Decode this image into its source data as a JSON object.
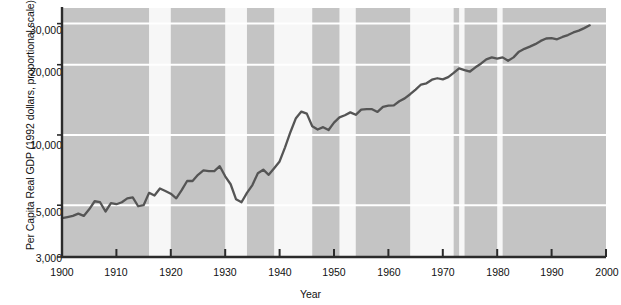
{
  "chart_data": {
    "type": "line",
    "title": "",
    "xlabel": "Year",
    "ylabel": "Per Capita Real GDP (1992 dollars, proportional scale)",
    "yscale": "log",
    "ylim": [
      3000,
      35000
    ],
    "xlim": [
      1900,
      2000
    ],
    "grid": true,
    "legend": "none",
    "yticks": [
      {
        "value": 3000,
        "label": "3,000"
      },
      {
        "value": 5000,
        "label": "5,000"
      },
      {
        "value": 10000,
        "label": "10,000"
      },
      {
        "value": 20000,
        "label": "20,000"
      },
      {
        "value": 30000,
        "label": "30,000"
      }
    ],
    "xticks": [
      {
        "value": 1900,
        "label": "1900"
      },
      {
        "value": 1910,
        "label": "1910"
      },
      {
        "value": 1920,
        "label": "1920"
      },
      {
        "value": 1930,
        "label": "1930"
      },
      {
        "value": 1940,
        "label": "1940"
      },
      {
        "value": 1950,
        "label": "1950"
      },
      {
        "value": 1960,
        "label": "1960"
      },
      {
        "value": 1970,
        "label": "1970"
      },
      {
        "value": 1980,
        "label": "1980"
      },
      {
        "value": 1990,
        "label": "1990"
      },
      {
        "value": 2000,
        "label": "2000"
      }
    ],
    "series": [
      {
        "name": "Per Capita Real GDP",
        "color": "#555555",
        "x": [
          1900,
          1901,
          1902,
          1903,
          1904,
          1905,
          1906,
          1907,
          1908,
          1909,
          1910,
          1911,
          1912,
          1913,
          1914,
          1915,
          1916,
          1917,
          1918,
          1919,
          1920,
          1921,
          1922,
          1923,
          1924,
          1925,
          1926,
          1927,
          1928,
          1929,
          1930,
          1931,
          1932,
          1933,
          1934,
          1935,
          1936,
          1937,
          1938,
          1939,
          1940,
          1941,
          1942,
          1943,
          1944,
          1945,
          1946,
          1947,
          1948,
          1949,
          1950,
          1951,
          1952,
          1953,
          1954,
          1955,
          1956,
          1957,
          1958,
          1959,
          1960,
          1961,
          1962,
          1963,
          1964,
          1965,
          1966,
          1967,
          1968,
          1969,
          1970,
          1971,
          1972,
          1973,
          1974,
          1975,
          1976,
          1977,
          1978,
          1979,
          1980,
          1981,
          1982,
          1983,
          1984,
          1985,
          1986,
          1987,
          1988,
          1989,
          1990,
          1991,
          1992,
          1993,
          1994,
          1995,
          1996,
          1997
        ],
        "y": [
          4400,
          4450,
          4500,
          4600,
          4500,
          4800,
          5200,
          5150,
          4700,
          5100,
          5050,
          5150,
          5350,
          5400,
          4950,
          5000,
          5650,
          5500,
          5900,
          5750,
          5600,
          5350,
          5800,
          6350,
          6350,
          6750,
          7050,
          7000,
          7000,
          7350,
          6650,
          6150,
          5300,
          5150,
          5650,
          6100,
          6850,
          7100,
          6750,
          7200,
          7700,
          8850,
          10300,
          11800,
          12600,
          12350,
          10900,
          10550,
          10800,
          10500,
          11300,
          11900,
          12150,
          12500,
          12200,
          12850,
          12900,
          12900,
          12550,
          13200,
          13350,
          13400,
          13950,
          14350,
          14950,
          15650,
          16450,
          16650,
          17250,
          17500,
          17300,
          17700,
          18450,
          19300,
          18950,
          18700,
          19500,
          20200,
          21100,
          21500,
          21250,
          21500,
          20800,
          21500,
          22750,
          23400,
          23900,
          24500,
          25300,
          25900,
          26000,
          25700,
          26300,
          26800,
          27500,
          28000,
          28700,
          29500
        ]
      }
    ],
    "shaded_events": [
      {
        "label": "World\nWar I",
        "name": "world-war-i",
        "start": 1916,
        "end": 1920
      },
      {
        "label": "Great\nDepression",
        "name": "great-depression",
        "start": 1930,
        "end": 1934
      },
      {
        "label": "World\nWar II",
        "name": "world-war-ii",
        "start": 1939,
        "end": 1946
      },
      {
        "label": "Korean\nWar",
        "name": "korean-war",
        "start": 1951,
        "end": 1954
      },
      {
        "label": "Vietnam\nWar",
        "name": "vietnam-war",
        "start": 1964,
        "end": 1972
      },
      {
        "label": "First oil\nprice shock",
        "name": "first-oil-price-shock",
        "start": 1973,
        "end": 1974
      },
      {
        "label": "Second oil\nprice shock",
        "name": "second-oil-price-shock",
        "start": 1980,
        "end": 1981
      }
    ],
    "annotations": [
      {
        "id": "world-war-i",
        "line1": "World",
        "line2": "War I",
        "x": 162,
        "y": 16
      },
      {
        "id": "great-depression",
        "line1": "Great",
        "line2": "Depression",
        "x": 239,
        "y": 16
      },
      {
        "id": "world-war-ii",
        "line1": "World",
        "line2": "War II",
        "x": 300,
        "y": 16
      },
      {
        "id": "korean-war",
        "line1": "Korean",
        "line2": "War",
        "x": 347,
        "y": 16
      },
      {
        "id": "vietnam-war",
        "line1": "Vietnam",
        "line2": "War",
        "x": 432,
        "y": 16
      },
      {
        "id": "second-oil-price-shock",
        "line1": "Second oil",
        "line2": "price shock",
        "x": 508,
        "y": 16
      },
      {
        "id": "first-oil-price-shock",
        "line1": "First oil",
        "line2": "price shock",
        "x": 472,
        "y": 44
      }
    ],
    "colors": {
      "plot_background": "#c4c4c4",
      "band_background": "#f7f7f7",
      "gridline": "#ffffff",
      "line": "#555555",
      "axis": "#2b2b2b",
      "text": "#111111"
    }
  }
}
